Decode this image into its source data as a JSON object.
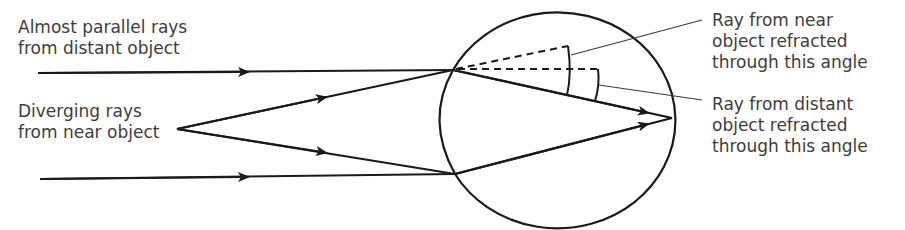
{
  "labels": {
    "distant_rays": [
      "Almost parallel rays",
      "from distant object"
    ],
    "near_rays": [
      "Diverging rays",
      "from near object"
    ],
    "near_angle": [
      "Ray from near",
      "object refracted",
      "through this angle"
    ],
    "distant_angle": [
      "Ray from distant",
      "object refracted",
      "through this angle"
    ]
  },
  "colors": {
    "line": "#1a1a1a",
    "text": "#3d3d3d",
    "background": "#ffffff"
  }
}
